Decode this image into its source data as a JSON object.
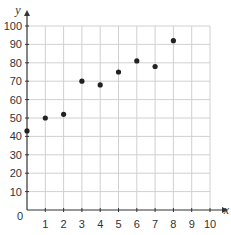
{
  "chart_data": {
    "type": "scatter",
    "title": "",
    "xlabel": "x",
    "ylabel": "y",
    "xlim": [
      0,
      10
    ],
    "ylim": [
      0,
      100
    ],
    "grid": true,
    "x_ticks": [
      1,
      2,
      3,
      4,
      5,
      6,
      7,
      8,
      9,
      10
    ],
    "y_ticks": [
      10,
      20,
      30,
      40,
      50,
      60,
      70,
      80,
      90,
      100
    ],
    "origin_label": "0",
    "points": [
      {
        "x": 0,
        "y": 43
      },
      {
        "x": 1,
        "y": 50
      },
      {
        "x": 2,
        "y": 52
      },
      {
        "x": 3,
        "y": 70
      },
      {
        "x": 4,
        "y": 68
      },
      {
        "x": 5,
        "y": 75
      },
      {
        "x": 6,
        "y": 81
      },
      {
        "x": 7,
        "y": 78
      },
      {
        "x": 8,
        "y": 92
      }
    ],
    "colors": {
      "grid": "#d0d0d0",
      "axis": "#333333",
      "point": "#222222"
    }
  }
}
